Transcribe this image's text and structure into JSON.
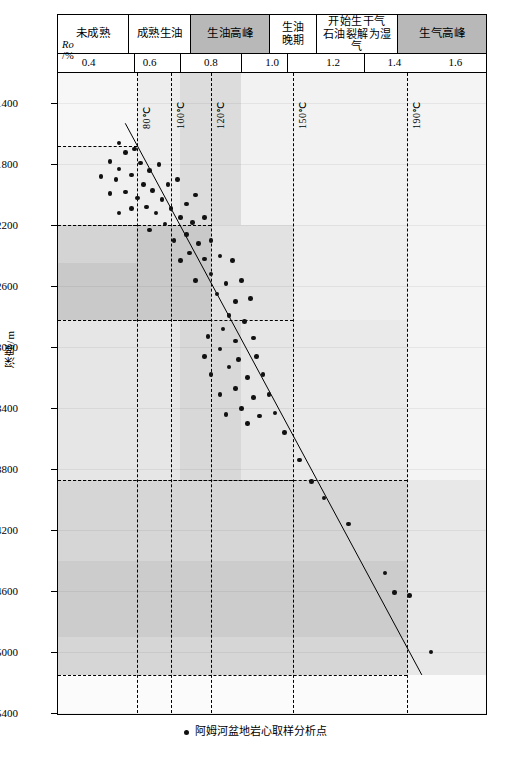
{
  "chart_data": {
    "type": "scatter",
    "title": "",
    "xlabel": "Ro /%",
    "ylabel": "深度/m",
    "xlim": [
      0.3,
      1.7
    ],
    "ylim": [
      5400,
      1200
    ],
    "grid": false,
    "legend_position": "bottom",
    "x_ticks": [
      0.4,
      0.6,
      0.8,
      1.0,
      1.2,
      1.4,
      1.6
    ],
    "y_ticks": [
      1400,
      1800,
      2200,
      2600,
      3000,
      3400,
      3800,
      4200,
      4600,
      5000,
      5400
    ],
    "maturity_zones": [
      {
        "label": "未成熟",
        "ro_range": [
          0.3,
          0.55
        ]
      },
      {
        "label": "成熟生油",
        "ro_range": [
          0.55,
          0.7
        ]
      },
      {
        "label": "生油高峰",
        "ro_range": [
          0.7,
          0.9
        ]
      },
      {
        "label": "生油\n晚期",
        "ro_range": [
          0.9,
          1.05
        ]
      },
      {
        "label": "开始生干气\n石油裂解为湿气",
        "ro_range": [
          1.05,
          1.3
        ]
      },
      {
        "label": "生气高峰",
        "ro_range": [
          1.3,
          1.7
        ]
      }
    ],
    "isotherms": [
      {
        "label": "80℃",
        "ro": 0.56
      },
      {
        "label": "100℃",
        "ro": 0.67
      },
      {
        "label": "120℃",
        "ro": 0.8
      },
      {
        "label": "150℃",
        "ro": 1.07
      },
      {
        "label": "190℃",
        "ro": 1.44
      }
    ],
    "trend_line": {
      "x1": 0.52,
      "y1": 1530,
      "x2": 1.49,
      "y2": 5150
    },
    "series": [
      {
        "name": "阿姆河盆地岩心取样分析点",
        "marker": "filled-circle",
        "color": "#111111",
        "points": [
          [
            0.5,
            1660
          ],
          [
            0.52,
            1720
          ],
          [
            0.47,
            1780
          ],
          [
            0.55,
            1700
          ],
          [
            0.5,
            1830
          ],
          [
            0.57,
            1790
          ],
          [
            0.44,
            1880
          ],
          [
            0.49,
            1900
          ],
          [
            0.54,
            1870
          ],
          [
            0.6,
            1840
          ],
          [
            0.63,
            1800
          ],
          [
            0.58,
            1930
          ],
          [
            0.52,
            1980
          ],
          [
            0.47,
            1990
          ],
          [
            0.56,
            2020
          ],
          [
            0.61,
            1970
          ],
          [
            0.66,
            1930
          ],
          [
            0.69,
            1900
          ],
          [
            0.64,
            2030
          ],
          [
            0.59,
            2080
          ],
          [
            0.54,
            2090
          ],
          [
            0.5,
            2120
          ],
          [
            0.62,
            2120
          ],
          [
            0.67,
            2090
          ],
          [
            0.72,
            2060
          ],
          [
            0.75,
            2000
          ],
          [
            0.7,
            2150
          ],
          [
            0.65,
            2190
          ],
          [
            0.6,
            2230
          ],
          [
            0.74,
            2180
          ],
          [
            0.78,
            2150
          ],
          [
            0.72,
            2260
          ],
          [
            0.68,
            2300
          ],
          [
            0.76,
            2320
          ],
          [
            0.8,
            2300
          ],
          [
            0.73,
            2380
          ],
          [
            0.7,
            2430
          ],
          [
            0.78,
            2420
          ],
          [
            0.83,
            2400
          ],
          [
            0.87,
            2430
          ],
          [
            0.8,
            2520
          ],
          [
            0.75,
            2560
          ],
          [
            0.85,
            2580
          ],
          [
            0.9,
            2560
          ],
          [
            0.82,
            2650
          ],
          [
            0.88,
            2700
          ],
          [
            0.93,
            2680
          ],
          [
            0.86,
            2790
          ],
          [
            0.91,
            2830
          ],
          [
            0.84,
            2880
          ],
          [
            0.79,
            2930
          ],
          [
            0.88,
            2960
          ],
          [
            0.94,
            2940
          ],
          [
            0.83,
            3010
          ],
          [
            0.78,
            3060
          ],
          [
            0.89,
            3080
          ],
          [
            0.95,
            3060
          ],
          [
            0.86,
            3130
          ],
          [
            0.8,
            3180
          ],
          [
            0.92,
            3200
          ],
          [
            0.97,
            3180
          ],
          [
            0.88,
            3270
          ],
          [
            0.83,
            3310
          ],
          [
            0.94,
            3330
          ],
          [
            0.99,
            3310
          ],
          [
            0.9,
            3400
          ],
          [
            0.85,
            3440
          ],
          [
            0.96,
            3450
          ],
          [
            1.01,
            3430
          ],
          [
            0.92,
            3500
          ],
          [
            1.04,
            3560
          ],
          [
            1.09,
            3740
          ],
          [
            1.13,
            3880
          ],
          [
            1.17,
            3990
          ],
          [
            1.25,
            4160
          ],
          [
            1.37,
            4480
          ],
          [
            1.4,
            4610
          ],
          [
            1.45,
            4630
          ],
          [
            1.52,
            5000
          ]
        ]
      }
    ],
    "dashed_boxes": [
      {
        "ro_left": 0.3,
        "ro_right": 0.56,
        "depth_top": 1680,
        "depth_bottom": 2200
      },
      {
        "ro_left": 0.3,
        "ro_right": 0.8,
        "depth_top": 2200,
        "depth_bottom": 2820
      },
      {
        "ro_left": 0.3,
        "ro_right": 1.07,
        "depth_top": 2820,
        "depth_bottom": 3870
      },
      {
        "ro_left": 0.3,
        "ro_right": 1.44,
        "depth_top": 3870,
        "depth_bottom": 5150
      }
    ]
  },
  "legend": {
    "marker_label": "阿姆河盆地岩心取样分析点"
  },
  "caption": {
    "text": ""
  },
  "axis": {
    "y_title": "深度/m",
    "ro_symbol": "Ro",
    "ro_unit": "/%"
  }
}
